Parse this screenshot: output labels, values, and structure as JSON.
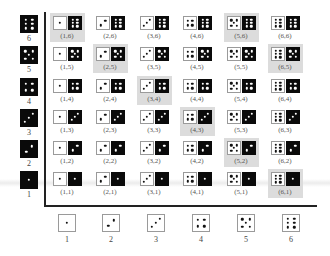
{
  "colors": {
    "highlight": "#dcdcdc",
    "white_die": "#ffffff",
    "black_die": "#0a0a0a",
    "axis": "#222222"
  },
  "row_axis": {
    "labels": [
      "6",
      "5",
      "4",
      "3",
      "2",
      "1"
    ],
    "values": [
      6,
      5,
      4,
      3,
      2,
      1
    ],
    "die_color": "black"
  },
  "col_axis": {
    "labels": [
      "1",
      "2",
      "3",
      "4",
      "5",
      "6"
    ],
    "values": [
      1,
      2,
      3,
      4,
      5,
      6
    ],
    "die_color": "white"
  },
  "grid": {
    "rows": [
      {
        "black": 6,
        "cells": [
          {
            "w": 1,
            "label": "(1,6)",
            "hl": true
          },
          {
            "w": 2,
            "label": "(2,6)",
            "hl": false
          },
          {
            "w": 3,
            "label": "(3,6)",
            "hl": false
          },
          {
            "w": 4,
            "label": "(4,6)",
            "hl": false
          },
          {
            "w": 5,
            "label": "(5,6)",
            "hl": true
          },
          {
            "w": 6,
            "label": "(6,6)",
            "hl": false
          }
        ]
      },
      {
        "black": 5,
        "cells": [
          {
            "w": 1,
            "label": "(1,5)",
            "hl": false
          },
          {
            "w": 2,
            "label": "(2,5)",
            "hl": true
          },
          {
            "w": 3,
            "label": "(3,5)",
            "hl": false
          },
          {
            "w": 4,
            "label": "(4,5)",
            "hl": false
          },
          {
            "w": 5,
            "label": "(5,5)",
            "hl": false
          },
          {
            "w": 6,
            "label": "(6,5)",
            "hl": true
          }
        ]
      },
      {
        "black": 4,
        "cells": [
          {
            "w": 1,
            "label": "(1,4)",
            "hl": false
          },
          {
            "w": 2,
            "label": "(2,4)",
            "hl": false
          },
          {
            "w": 3,
            "label": "(3,4)",
            "hl": true
          },
          {
            "w": 4,
            "label": "(4,4)",
            "hl": false
          },
          {
            "w": 5,
            "label": "(5,4)",
            "hl": false
          },
          {
            "w": 6,
            "label": "(6,4)",
            "hl": false
          }
        ]
      },
      {
        "black": 3,
        "cells": [
          {
            "w": 1,
            "label": "(1,3)",
            "hl": false
          },
          {
            "w": 2,
            "label": "(2,3)",
            "hl": false
          },
          {
            "w": 3,
            "label": "(3,3)",
            "hl": false
          },
          {
            "w": 4,
            "label": "(4,3)",
            "hl": true
          },
          {
            "w": 5,
            "label": "(5,3)",
            "hl": false
          },
          {
            "w": 6,
            "label": "(6,3)",
            "hl": false
          }
        ]
      },
      {
        "black": 2,
        "cells": [
          {
            "w": 1,
            "label": "(1,2)",
            "hl": false
          },
          {
            "w": 2,
            "label": "(2,2)",
            "hl": false
          },
          {
            "w": 3,
            "label": "(3,2)",
            "hl": false
          },
          {
            "w": 4,
            "label": "(4,2)",
            "hl": false
          },
          {
            "w": 5,
            "label": "(5,2)",
            "hl": true
          },
          {
            "w": 6,
            "label": "(6,2)",
            "hl": false
          }
        ]
      },
      {
        "black": 1,
        "cells": [
          {
            "w": 1,
            "label": "(1,1)",
            "hl": false
          },
          {
            "w": 2,
            "label": "(2,1)",
            "hl": false
          },
          {
            "w": 3,
            "label": "(3,1)",
            "hl": false
          },
          {
            "w": 4,
            "label": "(4,1)",
            "hl": false
          },
          {
            "w": 5,
            "label": "(5,1)",
            "hl": false
          },
          {
            "w": 6,
            "label": "(6,1)",
            "hl": true
          }
        ]
      }
    ]
  }
}
